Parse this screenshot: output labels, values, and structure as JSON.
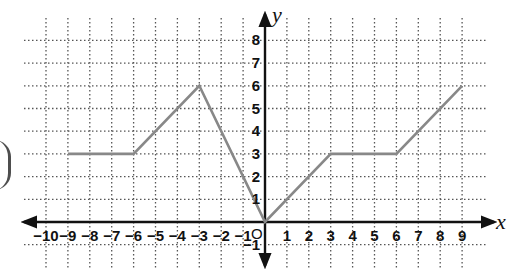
{
  "chart_data": {
    "type": "line",
    "title": "",
    "xlabel": "x",
    "ylabel": "y",
    "origin_label": "O",
    "xlim": [
      -10,
      9
    ],
    "ylim": [
      -1,
      8
    ],
    "grid": true,
    "grid_style": "dotted",
    "x_ticks": [
      -10,
      -9,
      -8,
      -7,
      -6,
      -5,
      -4,
      -3,
      -2,
      -1,
      1,
      2,
      3,
      4,
      5,
      6,
      7,
      8,
      9
    ],
    "y_ticks": [
      -1,
      1,
      2,
      3,
      4,
      5,
      6,
      7,
      8
    ],
    "series": [
      {
        "name": "piecewise function",
        "color": "#888888",
        "points": [
          [
            -9,
            3
          ],
          [
            -6,
            3
          ],
          [
            -3,
            6
          ],
          [
            0,
            0
          ],
          [
            3,
            3
          ],
          [
            6,
            3
          ],
          [
            9,
            6
          ]
        ]
      }
    ]
  },
  "colors": {
    "grid": "#555555",
    "axis": "#111111",
    "line": "#888888",
    "background": "#ffffff"
  }
}
